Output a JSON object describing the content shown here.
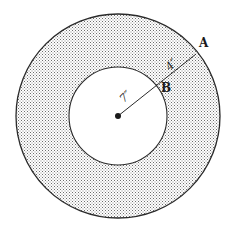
{
  "diagram": {
    "type": "annulus",
    "center": {
      "x": 118,
      "y": 116
    },
    "outer_radius_px": 102,
    "inner_radius_px": 49,
    "colors": {
      "stroke": "#2a2a2a",
      "shade_dot": "#6e6e6e",
      "background": "#ffffff"
    },
    "points": [
      {
        "name": "A",
        "label": "A",
        "x": 196,
        "y": 54,
        "label_x": 199,
        "label_y": 47
      },
      {
        "name": "B",
        "label": "B",
        "x": 155,
        "y": 85,
        "label_x": 161,
        "label_y": 92
      }
    ],
    "dimensions": [
      {
        "name": "inner-radius",
        "label": "7″",
        "value": 7,
        "unit": "inches",
        "x": 124,
        "y": 103,
        "rotate": -45
      },
      {
        "name": "ring-width",
        "label": "4″",
        "value": 4,
        "unit": "inches",
        "x": 172,
        "y": 69,
        "rotate": -45
      }
    ]
  }
}
